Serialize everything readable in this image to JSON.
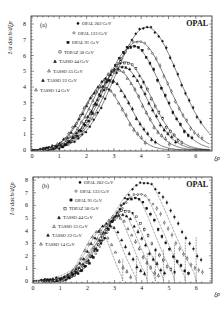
{
  "figure": {
    "experiment_label": "OPAL",
    "x_axis_label": "ξp",
    "y_axis_label": "1/σ dσch/dξp"
  },
  "chart_data": [
    {
      "type": "scatter",
      "panel": "(a)",
      "title": "",
      "brand": "OPAL",
      "xlabel": "ξp",
      "ylabel": "1/σ dσch/dξp",
      "xlim": [
        0,
        6.5
      ],
      "ylim": [
        0,
        8.4
      ],
      "xticks": [
        0,
        1,
        2,
        3,
        4,
        5,
        6
      ],
      "yticks": [
        0,
        1,
        2,
        3,
        4,
        5,
        6,
        7,
        8
      ],
      "grid": false,
      "legend_position": "upper left",
      "fit_style": "solid",
      "series": [
        {
          "name": "OPAL 202 GeV",
          "marker": "filled-circle",
          "peak_x": 4.2,
          "peak_y": 7.8,
          "width": 1.15
        },
        {
          "name": "OPAL 133 GeV",
          "marker": "open-circle",
          "peak_x": 3.9,
          "peak_y": 6.9,
          "width": 1.08
        },
        {
          "name": "OPAL 91 GeV",
          "marker": "filled-square",
          "peak_x": 3.7,
          "peak_y": 6.6,
          "width": 1.03
        },
        {
          "name": "TOPAZ 58 GeV",
          "marker": "open-square",
          "peak_x": 3.4,
          "peak_y": 5.6,
          "width": 0.95
        },
        {
          "name": "TASSO 44 GeV",
          "marker": "filled-triangle",
          "peak_x": 3.3,
          "peak_y": 5.3,
          "width": 0.92
        },
        {
          "name": "TASSO 35 GeV",
          "marker": "open-triangle",
          "peak_x": 3.1,
          "peak_y": 5.1,
          "width": 0.88
        },
        {
          "name": "TASSO 22 GeV",
          "marker": "filled-triangle",
          "peak_x": 2.8,
          "peak_y": 4.5,
          "width": 0.82
        },
        {
          "name": "TASSO 14 GeV",
          "marker": "open-triangle",
          "peak_x": 2.6,
          "peak_y": 4.0,
          "width": 0.76
        }
      ]
    },
    {
      "type": "scatter",
      "panel": "(b)",
      "title": "",
      "brand": "OPAL",
      "xlabel": "ξp",
      "ylabel": "1/σ dσch/dξp",
      "xlim": [
        0,
        6.5
      ],
      "ylim": [
        0,
        8.4
      ],
      "xticks": [
        0,
        1,
        2,
        3,
        4,
        5,
        6
      ],
      "yticks": [
        0,
        1,
        2,
        3,
        4,
        5,
        6,
        7,
        8
      ],
      "grid": false,
      "legend_position": "upper left",
      "fit_style": "dotted",
      "series": [
        {
          "name": "OPAL 202 GeV",
          "marker": "filled-circle",
          "peak_x": 4.1,
          "peak_y": 7.8,
          "endpoint_x": 6.0
        },
        {
          "name": "OPAL 133 GeV",
          "marker": "open-circle",
          "peak_x": 3.9,
          "peak_y": 6.9,
          "endpoint_x": 5.6
        },
        {
          "name": "OPAL 91 GeV",
          "marker": "filled-square",
          "peak_x": 3.7,
          "peak_y": 6.6,
          "endpoint_x": 5.2
        },
        {
          "name": "TOPAZ 58 GeV",
          "marker": "open-square",
          "peak_x": 3.4,
          "peak_y": 5.6,
          "endpoint_x": 4.8
        },
        {
          "name": "TASSO 44 GeV",
          "marker": "filled-triangle",
          "peak_x": 3.25,
          "peak_y": 5.3,
          "endpoint_x": 4.5
        },
        {
          "name": "TASSO 35 GeV",
          "marker": "open-triangle",
          "peak_x": 3.05,
          "peak_y": 5.1,
          "endpoint_x": 4.2
        },
        {
          "name": "TASSO 22 GeV",
          "marker": "filled-triangle",
          "peak_x": 2.75,
          "peak_y": 4.5,
          "endpoint_x": 3.8
        },
        {
          "name": "TASSO 14 GeV",
          "marker": "open-triangle",
          "peak_x": 2.45,
          "peak_y": 4.0,
          "endpoint_x": 3.3
        }
      ]
    }
  ]
}
